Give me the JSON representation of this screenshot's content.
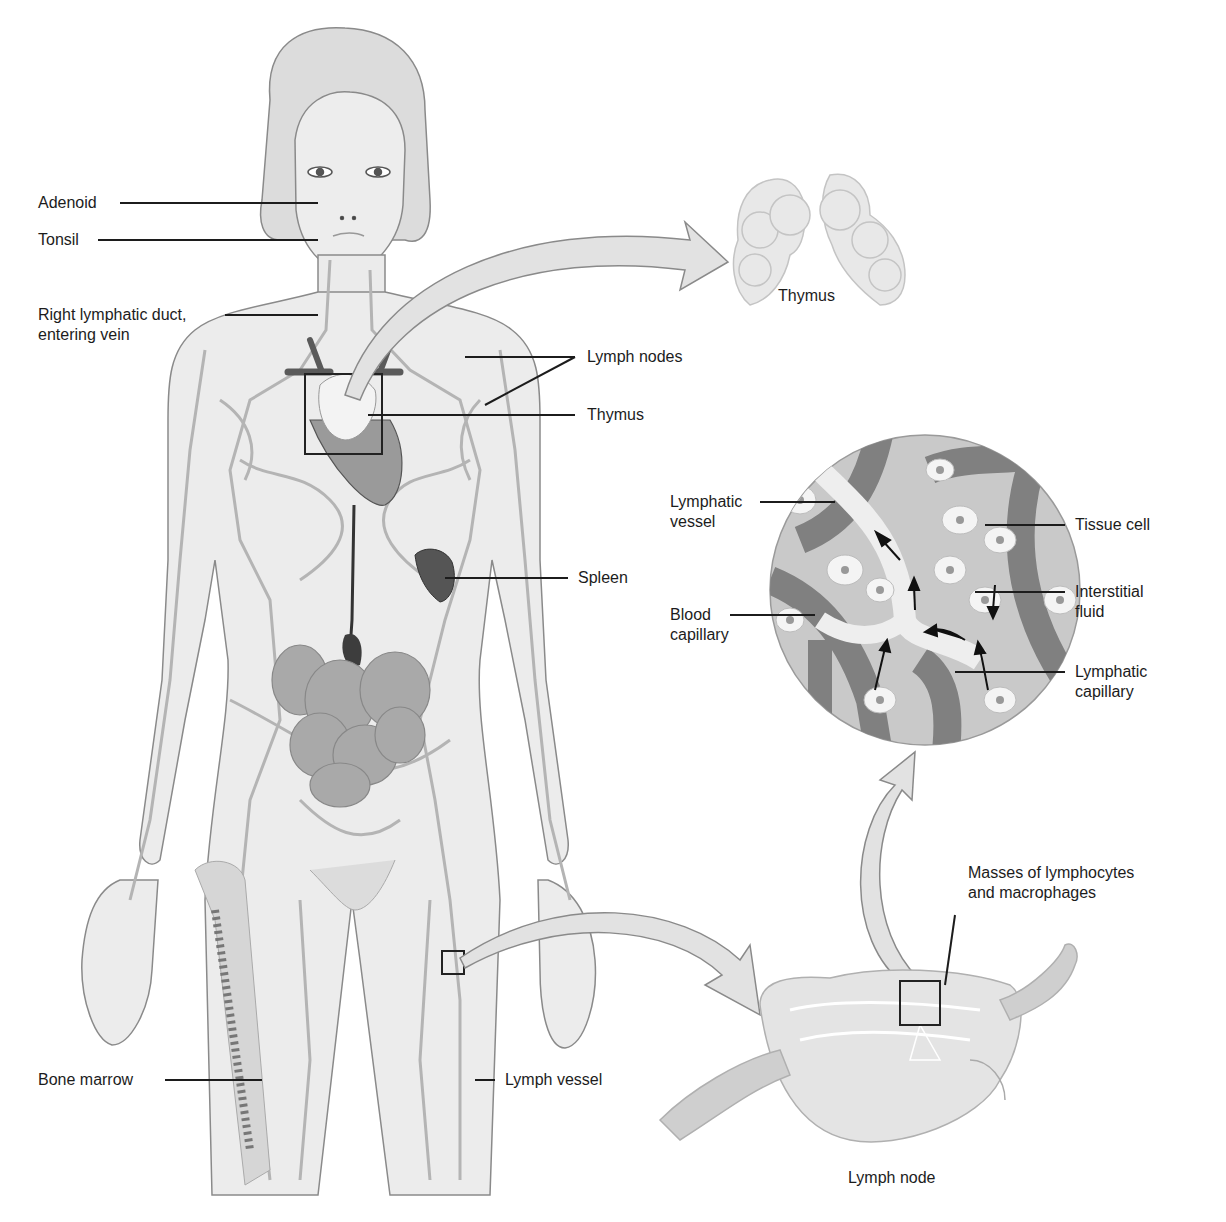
{
  "figure": {
    "colors": {
      "background": "#ffffff",
      "skin": "#e9e9e9",
      "outline": "#8a8a8a",
      "vessel": "#b8b8b8",
      "organ_dark": "#5a5a5a",
      "intestine": "#a8a8a8",
      "leader_line": "#1c1c1c",
      "arrow_fill": "#e0e0e0",
      "capillary": "#7d7d7d",
      "tissue": "#c9c9c9"
    }
  },
  "labels": {
    "adenoid": "Adenoid",
    "tonsil": "Tonsil",
    "right_lymphatic_duct": "Right lymphatic duct,\nentering vein",
    "lymph_nodes": "Lymph nodes",
    "thymus_body": "Thymus",
    "thymus_detail": "Thymus",
    "spleen": "Spleen",
    "bone_marrow": "Bone marrow",
    "lymph_vessel": "Lymph vessel",
    "lymphatic_vessel": "Lymphatic\nvessel",
    "blood_capillary": "Blood\ncapillary",
    "tissue_cell": "Tissue cell",
    "interstitial_fluid": "Interstitial\nfluid",
    "lymphatic_capillary": "Lymphatic\ncapillary",
    "masses": "Masses of lymphocytes\nand macrophages",
    "lymph_node": "Lymph node"
  }
}
